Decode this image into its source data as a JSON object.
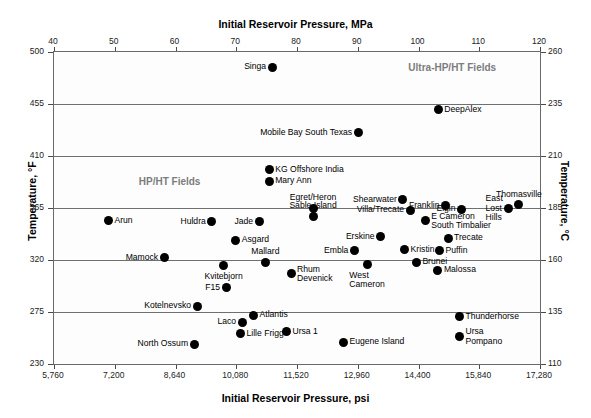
{
  "chart_data": {
    "type": "scatter",
    "title": "",
    "xlabel": "Initial Reservoir Pressure, psi",
    "xlabel_top": "Initial Reservoir Pressure, MPa",
    "ylabel": "Temperature, °F",
    "ylabel_right": "Temperature, °C",
    "xlim": [
      5760,
      17280
    ],
    "ylim": [
      230,
      500
    ],
    "xlim_top": [
      40,
      120
    ],
    "ylim_right": [
      110,
      260
    ],
    "grid": true,
    "legend": "none",
    "xticks": [
      "5,760",
      "7,200",
      "8,640",
      "10,080",
      "11,520",
      "12,960",
      "14,400",
      "15,840",
      "17,280"
    ],
    "xtick_values": [
      5760,
      7200,
      8640,
      10080,
      11520,
      12960,
      14400,
      15840,
      17280
    ],
    "xticks_top": [
      "40",
      "50",
      "60",
      "70",
      "80",
      "90",
      "100",
      "110",
      "120"
    ],
    "xtick_top_values": [
      40,
      50,
      60,
      70,
      80,
      90,
      100,
      110,
      120
    ],
    "yticks": [
      "500",
      "455",
      "410",
      "365",
      "320",
      "275",
      "230"
    ],
    "ytick_values": [
      500,
      455,
      410,
      365,
      320,
      275,
      230
    ],
    "yticks_right": [
      "260",
      "235",
      "210",
      "185",
      "160",
      "135",
      "110"
    ],
    "ytick_right_values": [
      260,
      235,
      210,
      185,
      160,
      135,
      110
    ],
    "gridlines_y": [
      455,
      410,
      365,
      320,
      275
    ],
    "annotations": [
      {
        "text": "Ultra-HP/HT Fields",
        "x": 15200,
        "y": 487,
        "align": "center"
      },
      {
        "text": "HP/HT Fields",
        "x": 8500,
        "y": 388,
        "align": "center"
      }
    ],
    "points": [
      {
        "label": "Singa",
        "x": 10930,
        "y": 487,
        "pos": "left"
      },
      {
        "label": "DeepAlex",
        "x": 14870,
        "y": 450,
        "pos": "right"
      },
      {
        "label": "Mobile Bay South Texas",
        "x": 12970,
        "y": 430,
        "pos": "left"
      },
      {
        "label": "KG Offshore India",
        "x": 10860,
        "y": 398,
        "pos": "right"
      },
      {
        "label": "Mary Ann",
        "x": 10860,
        "y": 388,
        "pos": "right"
      },
      {
        "label": "Shearwater",
        "x": 14030,
        "y": 372,
        "pos": "left"
      },
      {
        "label": "Thomasville",
        "x": 16780,
        "y": 368,
        "pos": "above"
      },
      {
        "label": "Franklin",
        "x": 15040,
        "y": 367,
        "pos": "left"
      },
      {
        "label": "East\nLost\nHills",
        "x": 16540,
        "y": 365,
        "pos": "left"
      },
      {
        "label": "Egret/Heron",
        "x": 11900,
        "y": 365,
        "pos": "above"
      },
      {
        "label": "Sable Island",
        "x": 11900,
        "y": 358,
        "pos": "above"
      },
      {
        "label": "Villa/Trecate",
        "x": 14200,
        "y": 363,
        "pos": "left"
      },
      {
        "label": "Elgin",
        "x": 15420,
        "y": 364,
        "pos": "left"
      },
      {
        "label": "Arun",
        "x": 7050,
        "y": 354,
        "pos": "right"
      },
      {
        "label": "Huldra",
        "x": 9500,
        "y": 353,
        "pos": "left"
      },
      {
        "label": "Jade",
        "x": 10620,
        "y": 353,
        "pos": "left"
      },
      {
        "label": "E Cameron\nSouth Timbalier",
        "x": 14560,
        "y": 354,
        "pos": "right"
      },
      {
        "label": "Erskine",
        "x": 13500,
        "y": 340,
        "pos": "left"
      },
      {
        "label": "Trecate",
        "x": 15100,
        "y": 339,
        "pos": "right"
      },
      {
        "label": "Asgard",
        "x": 10070,
        "y": 337,
        "pos": "right"
      },
      {
        "label": "Kristin",
        "x": 14070,
        "y": 329,
        "pos": "right"
      },
      {
        "label": "Puffin",
        "x": 14900,
        "y": 328,
        "pos": "right"
      },
      {
        "label": "Embla",
        "x": 12880,
        "y": 328,
        "pos": "left"
      },
      {
        "label": "Mamock",
        "x": 8370,
        "y": 322,
        "pos": "left"
      },
      {
        "label": "Mallard",
        "x": 10770,
        "y": 318,
        "pos": "above"
      },
      {
        "label": "West\nCameron",
        "x": 13180,
        "y": 316,
        "pos": "below"
      },
      {
        "label": "Brunei",
        "x": 14350,
        "y": 318,
        "pos": "right"
      },
      {
        "label": "Malossa",
        "x": 14860,
        "y": 311,
        "pos": "right"
      },
      {
        "label": "Kvitebjorn",
        "x": 9780,
        "y": 315,
        "pos": "below"
      },
      {
        "label": "Rhum\nDevenick",
        "x": 11380,
        "y": 308,
        "pos": "right"
      },
      {
        "label": "F15",
        "x": 9840,
        "y": 296,
        "pos": "left"
      },
      {
        "label": "Kotelnevsko",
        "x": 9150,
        "y": 280,
        "pos": "left"
      },
      {
        "label": "Atlantis",
        "x": 10490,
        "y": 272,
        "pos": "right"
      },
      {
        "label": "Thunderhorse",
        "x": 15370,
        "y": 271,
        "pos": "right"
      },
      {
        "label": "Laco",
        "x": 10220,
        "y": 266,
        "pos": "left"
      },
      {
        "label": "Lille Frigg",
        "x": 10180,
        "y": 256,
        "pos": "right"
      },
      {
        "label": "Ursa 1",
        "x": 11270,
        "y": 258,
        "pos": "right"
      },
      {
        "label": "Ursa\nPompano",
        "x": 15370,
        "y": 254,
        "pos": "right"
      },
      {
        "label": "North Ossum",
        "x": 9080,
        "y": 247,
        "pos": "left"
      },
      {
        "label": "Eugene Island",
        "x": 12620,
        "y": 249,
        "pos": "right"
      }
    ]
  }
}
